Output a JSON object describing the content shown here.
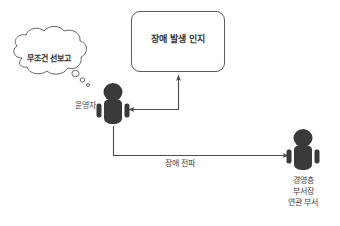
{
  "diagram": {
    "title_box": {
      "text": "장애 발생 인지",
      "border_color": "#5a5a5a",
      "fill_color": "#ffffff"
    },
    "thought_bubble": {
      "text": "무조건 선보고",
      "stroke_color": "#555555"
    },
    "actors": [
      {
        "id": "operator",
        "label": "운영자",
        "color": "#3a3a3a"
      },
      {
        "id": "management",
        "label_lines": [
          "경영층",
          "부서장",
          "연관 부서"
        ],
        "color": "#3a3a3a"
      }
    ],
    "connectors": [
      {
        "id": "recognize-to-operator",
        "label": "",
        "from": "장애 발생 인지",
        "to": "운영자",
        "color": "#4a4a4a"
      },
      {
        "id": "operator-to-management",
        "label": "장애 전파",
        "from": "운영자",
        "to": "경영층 부서장 연관 부서",
        "color": "#4a4a4a"
      }
    ],
    "colors": {
      "figure": "#3a3a3a",
      "line": "#4a4a4a",
      "text": "#3c3c3c",
      "background": "#ffffff"
    }
  }
}
